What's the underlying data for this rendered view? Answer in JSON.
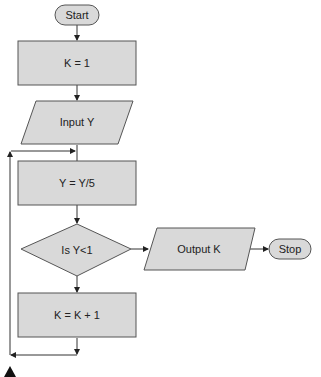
{
  "diagram": {
    "type": "flowchart",
    "nodes": {
      "start": {
        "shape": "terminator",
        "label": "Start"
      },
      "init": {
        "shape": "process",
        "label": "K = 1"
      },
      "input": {
        "shape": "io",
        "label": "Input Y"
      },
      "divide": {
        "shape": "process",
        "label": "Y = Y/5"
      },
      "decision": {
        "shape": "decision",
        "label": "Is Y<1"
      },
      "increment": {
        "shape": "process",
        "label": "K = K + 1"
      },
      "output": {
        "shape": "io",
        "label": "Output K"
      },
      "stop": {
        "shape": "terminator",
        "label": "Stop"
      }
    },
    "edges": [
      {
        "from": "start",
        "to": "init"
      },
      {
        "from": "init",
        "to": "input"
      },
      {
        "from": "input",
        "to": "divide"
      },
      {
        "from": "divide",
        "to": "decision"
      },
      {
        "from": "decision",
        "to": "output",
        "branch": "yes"
      },
      {
        "from": "decision",
        "to": "increment",
        "branch": "no"
      },
      {
        "from": "increment",
        "to": "divide",
        "kind": "loop-back"
      },
      {
        "from": "output",
        "to": "stop"
      }
    ]
  }
}
